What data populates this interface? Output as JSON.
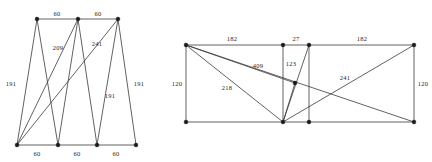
{
  "figure": {
    "title": "",
    "background": "#ffffff",
    "edge_color": "#3a3a3a",
    "node_color": "#1a1a1a",
    "label_color": "#1f1f1f",
    "width": 432,
    "height": 162
  },
  "chart_data": {
    "type": "diagram",
    "graphs": [
      {
        "id": "left-graph",
        "name": "left-network",
        "nodes": [
          {
            "id": "T1",
            "x": 37,
            "y": 19
          },
          {
            "id": "T2",
            "x": 78,
            "y": 19
          },
          {
            "id": "T3",
            "x": 118,
            "y": 19
          },
          {
            "id": "B1",
            "x": 17,
            "y": 145
          },
          {
            "id": "B2",
            "x": 58,
            "y": 145
          },
          {
            "id": "B3",
            "x": 97,
            "y": 145
          },
          {
            "id": "B4",
            "x": 136,
            "y": 145
          }
        ],
        "edges": [
          {
            "from": "T1",
            "to": "T2",
            "weight": "60"
          },
          {
            "from": "T2",
            "to": "T3",
            "weight": "60"
          },
          {
            "from": "B1",
            "to": "B2",
            "weight": "60"
          },
          {
            "from": "B2",
            "to": "B3",
            "weight": "60"
          },
          {
            "from": "B3",
            "to": "B4",
            "weight": "60"
          },
          {
            "from": "T1",
            "to": "B1",
            "weight": "191"
          },
          {
            "from": "T1",
            "to": "B2",
            "weight": ""
          },
          {
            "from": "T2",
            "to": "B1",
            "weight": "209"
          },
          {
            "from": "T2",
            "to": "B2",
            "weight": ""
          },
          {
            "from": "T2",
            "to": "B3",
            "weight": ""
          },
          {
            "from": "T3",
            "to": "B1",
            "weight": "241"
          },
          {
            "from": "T3",
            "to": "B3",
            "weight": "191"
          },
          {
            "from": "T3",
            "to": "B4",
            "weight": "191"
          }
        ],
        "labels": [
          {
            "text": "60",
            "x": 57,
            "y": 15
          },
          {
            "text": "60",
            "x": 98,
            "y": 15
          },
          {
            "text": "209",
            "x": 58,
            "y": 49
          },
          {
            "text": "241",
            "x": 97,
            "y": 45
          },
          {
            "text": "191",
            "x": 11,
            "y": 85
          },
          {
            "text": "191",
            "x": 110,
            "y": 97
          },
          {
            "text": "191",
            "x": 139,
            "y": 85
          },
          {
            "text": "60",
            "x": 37,
            "y": 155
          },
          {
            "text": "60",
            "x": 77,
            "y": 155
          },
          {
            "text": "60",
            "x": 116,
            "y": 155
          }
        ]
      },
      {
        "id": "right-graph",
        "name": "right-network",
        "nodes": [
          {
            "id": "U1",
            "x": 186,
            "y": 45
          },
          {
            "id": "U2",
            "x": 283,
            "y": 45
          },
          {
            "id": "U3",
            "x": 309,
            "y": 45
          },
          {
            "id": "U4",
            "x": 414,
            "y": 45
          },
          {
            "id": "M1",
            "x": 295,
            "y": 83
          },
          {
            "id": "L1",
            "x": 186,
            "y": 122
          },
          {
            "id": "L2",
            "x": 283,
            "y": 122
          },
          {
            "id": "L3",
            "x": 309,
            "y": 122
          },
          {
            "id": "L4",
            "x": 414,
            "y": 122
          }
        ],
        "edges": [
          {
            "from": "U1",
            "to": "U2",
            "weight": "182"
          },
          {
            "from": "U2",
            "to": "U3",
            "weight": "27"
          },
          {
            "from": "U3",
            "to": "U4",
            "weight": "182"
          },
          {
            "from": "L1",
            "to": "L4",
            "weight": ""
          },
          {
            "from": "U1",
            "to": "L1",
            "weight": "120"
          },
          {
            "from": "U4",
            "to": "L4",
            "weight": "120"
          },
          {
            "from": "U1",
            "to": "L4",
            "weight": "409"
          },
          {
            "from": "U1",
            "to": "L2",
            "weight": "218"
          },
          {
            "from": "U1",
            "to": "M1",
            "weight": ""
          },
          {
            "from": "U2",
            "to": "L2",
            "weight": ""
          },
          {
            "from": "U3",
            "to": "L3",
            "weight": ""
          },
          {
            "from": "U3",
            "to": "L2",
            "weight": ""
          },
          {
            "from": "M1",
            "to": "L2",
            "weight": "123"
          },
          {
            "from": "L2",
            "to": "U4",
            "weight": "241"
          }
        ],
        "labels": [
          {
            "text": "182",
            "x": 232,
            "y": 40
          },
          {
            "text": "27",
            "x": 296,
            "y": 40
          },
          {
            "text": "182",
            "x": 362,
            "y": 40
          },
          {
            "text": "409",
            "x": 258,
            "y": 67
          },
          {
            "text": "123",
            "x": 291,
            "y": 65
          },
          {
            "text": "241",
            "x": 345,
            "y": 79
          },
          {
            "text": "218",
            "x": 227,
            "y": 89
          },
          {
            "text": "120",
            "x": 177,
            "y": 85
          },
          {
            "text": "120",
            "x": 423,
            "y": 85
          }
        ]
      }
    ]
  }
}
